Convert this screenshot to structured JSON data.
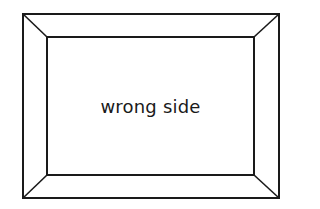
{
  "diagram": {
    "label": "wrong side",
    "stroke_color": "#1a1a1a",
    "background": "#ffffff",
    "outer_frame": {
      "x1": 23,
      "y1": 14,
      "x2": 279,
      "y2": 198
    },
    "inner_frame": {
      "x1": 47,
      "y1": 37,
      "x2": 254,
      "y2": 175
    }
  }
}
